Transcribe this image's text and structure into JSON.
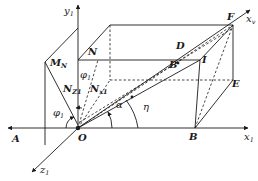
{
  "figure": {
    "type": "3d-geometry-diagram"
  },
  "axes": {
    "x1": {
      "name": "x",
      "sub": "1"
    },
    "y1": {
      "name": "y",
      "sub": "1"
    },
    "z1": {
      "name": "z",
      "sub": "1"
    },
    "xv": {
      "name": "x",
      "sub": "v"
    }
  },
  "points": {
    "O": "O",
    "A": "A",
    "B_bottom": "B",
    "B_mid": "B",
    "D": "D",
    "E": "E",
    "F": "F",
    "I": "I",
    "N": "N",
    "MN": {
      "name": "M",
      "sub": "N"
    },
    "NZ1": {
      "name": "N",
      "sub": "Z1"
    },
    "NX1": {
      "name": "N",
      "sub": "x1"
    }
  },
  "angles": {
    "phi1_upper": {
      "name": "φ",
      "sub": "1"
    },
    "phi1_lower": {
      "name": "φ",
      "sub": "1"
    },
    "alpha": "α",
    "eta": "η"
  },
  "colors": {
    "ink": "#1a1a1a",
    "background": "#ffffff"
  }
}
